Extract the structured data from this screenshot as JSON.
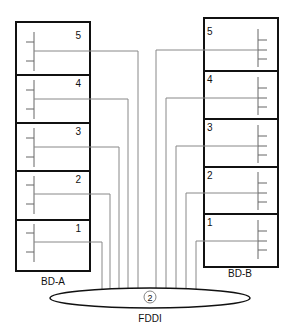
{
  "colors": {
    "box_stroke": "#111111",
    "wire_stroke": "#777777",
    "background": "#ffffff"
  },
  "left_distributor": {
    "label": "BD-A",
    "sections": [
      {
        "number": "5"
      },
      {
        "number": "4"
      },
      {
        "number": "3"
      },
      {
        "number": "2"
      },
      {
        "number": "1"
      }
    ]
  },
  "right_distributor": {
    "label": "BD-B",
    "sections": [
      {
        "number": "5"
      },
      {
        "number": "4"
      },
      {
        "number": "3"
      },
      {
        "number": "2"
      },
      {
        "number": "1"
      }
    ]
  },
  "ring": {
    "label": "FDDI",
    "marker": "2"
  }
}
